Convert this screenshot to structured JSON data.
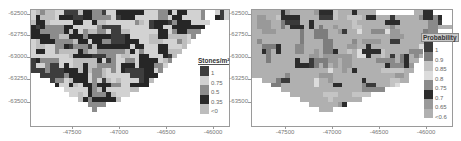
{
  "maps": [
    {
      "id": "stones",
      "legend_title": "Stones/m²",
      "legend": [
        {
          "label": "1",
          "color": "#3d3d3d"
        },
        {
          "label": "0.75",
          "color": "#d0d0d0"
        },
        {
          "label": "0.5",
          "color": "#8c8c8c"
        },
        {
          "label": "0.35",
          "color": "#2a2a2a"
        },
        {
          "label": "<0",
          "color": "#bdbdbd"
        }
      ],
      "y_ticks": [
        "-62500",
        "-62750",
        "-63000",
        "-63250",
        "-63500"
      ],
      "x_ticks": [
        "-47500",
        "-47000",
        "-46500",
        "-46000"
      ]
    },
    {
      "id": "probability",
      "legend_title": "Probability",
      "legend": [
        {
          "label": "1",
          "color": "#3a3a3a"
        },
        {
          "label": "0.9",
          "color": "#7d7d7d"
        },
        {
          "label": "0.85",
          "color": "#c4c4c4"
        },
        {
          "label": "0.8",
          "color": "#dcdcdc"
        },
        {
          "label": "0.75",
          "color": "#8a8a8a"
        },
        {
          "label": "0.7",
          "color": "#2c2c2c"
        },
        {
          "label": "0.65",
          "color": "#999999"
        },
        {
          "label": "<0.6",
          "color": "#b0b0b0"
        }
      ],
      "y_ticks": [
        "-62500",
        "-62750",
        "-63000",
        "-63250",
        "-63500"
      ],
      "x_ticks": [
        "-47500",
        "-47000",
        "-46500",
        "-46000"
      ]
    }
  ],
  "chart_data": [
    {
      "type": "heatmap",
      "title": "",
      "legend_title": "Stones/m²",
      "legend_entries": [
        "1",
        "0.75",
        "0.5",
        "0.35",
        "<0"
      ],
      "xlabel": "",
      "ylabel": "",
      "x_ticks": [
        -47500,
        -47000,
        -46500,
        -46000
      ],
      "y_ticks": [
        -62500,
        -62750,
        -63000,
        -63250,
        -63500
      ],
      "xlim": [
        -47850,
        -45950
      ],
      "ylim": [
        -63650,
        -62460
      ],
      "legend_position": "right-inside"
    },
    {
      "type": "heatmap",
      "title": "",
      "legend_title": "Probability",
      "legend_entries": [
        "1",
        "0.9",
        "0.85",
        "0.8",
        "0.75",
        "0.7",
        "0.65",
        "<0.6"
      ],
      "xlabel": "",
      "ylabel": "",
      "x_ticks": [
        -47500,
        -47000,
        -46500,
        -46000
      ],
      "y_ticks": [
        -62500,
        -62750,
        -63000,
        -63250,
        -63500
      ],
      "xlim": [
        -47850,
        -45950
      ],
      "ylim": [
        -63650,
        -62460
      ],
      "legend_position": "right-inside"
    }
  ]
}
